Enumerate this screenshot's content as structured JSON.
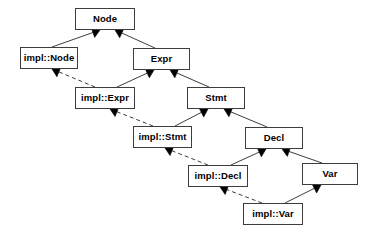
{
  "diagram": {
    "type": "uml-class-diagram",
    "title": "",
    "canvas": {
      "width": 377,
      "height": 234,
      "background": "#ffffff"
    },
    "style": {
      "box_border_color": "#3d3d3d",
      "box_fill_color": "#ffffff",
      "label_color": "#000000",
      "edge_color": "#3d3d3d",
      "arrowhead_fill": "#000000"
    },
    "nodes": [
      {
        "id": "node",
        "label": "Node",
        "x": 75,
        "y": 8,
        "w": 60,
        "h": 22,
        "kind": "interface"
      },
      {
        "id": "impl_node",
        "label": "impl::Node",
        "x": 20,
        "y": 47,
        "w": 58,
        "h": 22,
        "kind": "implementation"
      },
      {
        "id": "expr",
        "label": "Expr",
        "x": 133,
        "y": 48,
        "w": 57,
        "h": 22,
        "kind": "interface"
      },
      {
        "id": "impl_expr",
        "label": "impl::Expr",
        "x": 75,
        "y": 87,
        "w": 60,
        "h": 22,
        "kind": "implementation"
      },
      {
        "id": "stmt",
        "label": "Stmt",
        "x": 187,
        "y": 87,
        "w": 58,
        "h": 22,
        "kind": "interface"
      },
      {
        "id": "impl_stmt",
        "label": "impl::Stmt",
        "x": 133,
        "y": 126,
        "w": 59,
        "h": 22,
        "kind": "implementation"
      },
      {
        "id": "decl",
        "label": "Decl",
        "x": 245,
        "y": 127,
        "w": 58,
        "h": 22,
        "kind": "interface"
      },
      {
        "id": "impl_decl",
        "label": "impl::Decl",
        "x": 188,
        "y": 165,
        "w": 60,
        "h": 22,
        "kind": "implementation"
      },
      {
        "id": "var",
        "label": "Var",
        "x": 302,
        "y": 163,
        "w": 56,
        "h": 22,
        "kind": "interface"
      },
      {
        "id": "impl_var",
        "label": "impl::Var",
        "x": 243,
        "y": 203,
        "w": 60,
        "h": 22,
        "kind": "implementation"
      }
    ],
    "edges": [
      {
        "from": "impl_node",
        "to": "node",
        "style": "solid",
        "arrow": "filled-triangle",
        "relation": "generalization",
        "x1": 52,
        "y1": 47,
        "x2": 100,
        "y2": 30
      },
      {
        "from": "expr",
        "to": "node",
        "style": "solid",
        "arrow": "filled-triangle",
        "relation": "generalization",
        "x1": 155,
        "y1": 48,
        "x2": 115,
        "y2": 30
      },
      {
        "from": "impl_expr",
        "to": "impl_node",
        "style": "dashed",
        "arrow": "filled-triangle",
        "relation": "realization",
        "x1": 95,
        "y1": 87,
        "x2": 52,
        "y2": 69
      },
      {
        "from": "impl_expr",
        "to": "expr",
        "style": "solid",
        "arrow": "filled-triangle",
        "relation": "generalization",
        "x1": 117,
        "y1": 87,
        "x2": 154,
        "y2": 70
      },
      {
        "from": "stmt",
        "to": "expr",
        "style": "solid",
        "arrow": "filled-triangle",
        "relation": "generalization",
        "x1": 209,
        "y1": 87,
        "x2": 170,
        "y2": 70
      },
      {
        "from": "impl_stmt",
        "to": "impl_expr",
        "style": "dashed",
        "arrow": "filled-triangle",
        "relation": "realization",
        "x1": 153,
        "y1": 126,
        "x2": 110,
        "y2": 109
      },
      {
        "from": "impl_stmt",
        "to": "stmt",
        "style": "solid",
        "arrow": "filled-triangle",
        "relation": "generalization",
        "x1": 175,
        "y1": 126,
        "x2": 208,
        "y2": 109
      },
      {
        "from": "decl",
        "to": "stmt",
        "style": "solid",
        "arrow": "filled-triangle",
        "relation": "generalization",
        "x1": 267,
        "y1": 127,
        "x2": 224,
        "y2": 109
      },
      {
        "from": "impl_decl",
        "to": "impl_stmt",
        "style": "dashed",
        "arrow": "filled-triangle",
        "relation": "realization",
        "x1": 208,
        "y1": 165,
        "x2": 165,
        "y2": 148
      },
      {
        "from": "impl_decl",
        "to": "decl",
        "style": "solid",
        "arrow": "filled-triangle",
        "relation": "generalization",
        "x1": 231,
        "y1": 165,
        "x2": 266,
        "y2": 149
      },
      {
        "from": "var",
        "to": "decl",
        "style": "solid",
        "arrow": "filled-triangle",
        "relation": "generalization",
        "x1": 322,
        "y1": 163,
        "x2": 282,
        "y2": 149
      },
      {
        "from": "impl_var",
        "to": "impl_decl",
        "style": "dashed",
        "arrow": "filled-triangle",
        "relation": "realization",
        "x1": 262,
        "y1": 203,
        "x2": 220,
        "y2": 187
      },
      {
        "from": "impl_var",
        "to": "var",
        "style": "solid",
        "arrow": "filled-triangle",
        "relation": "generalization",
        "x1": 285,
        "y1": 203,
        "x2": 321,
        "y2": 185
      }
    ]
  }
}
